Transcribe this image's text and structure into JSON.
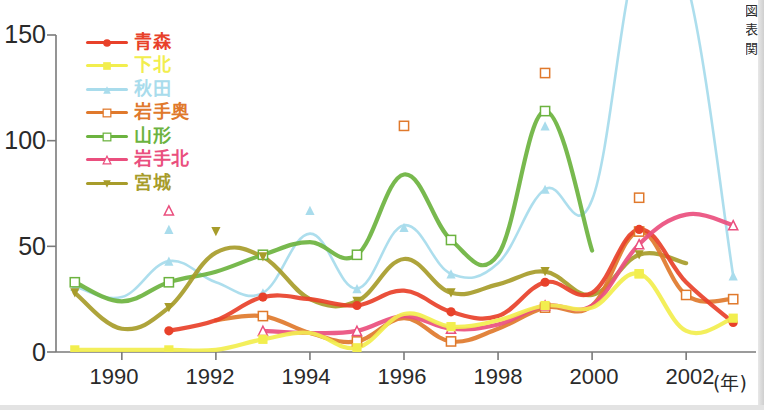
{
  "chart_data": {
    "type": "line",
    "title": "",
    "xlabel": "年",
    "ylabel": "",
    "xlim": [
      1988.6,
      2003.4
    ],
    "ylim": [
      0,
      150
    ],
    "grid": false,
    "legend_position": "top-left",
    "x_ticks": [
      "1990",
      "1992",
      "1994",
      "1996",
      "1998",
      "2000",
      "2002"
    ],
    "x_tick_values": [
      1990,
      1992,
      1994,
      1996,
      1998,
      2000,
      2002
    ],
    "y_ticks": [
      "0",
      "50",
      "100",
      "150"
    ],
    "y_tick_values": [
      0,
      50,
      100,
      150
    ],
    "x": [
      1989,
      1990,
      1991,
      1992,
      1993,
      1994,
      1995,
      1996,
      1997,
      1998,
      1999,
      2000,
      2001,
      2002,
      2003
    ],
    "series": [
      {
        "name": "青森",
        "color": "#e8412a",
        "marker": "filled-circle",
        "values": [
          null,
          null,
          10,
          15,
          26,
          25,
          22,
          29,
          19,
          17,
          33,
          28,
          58,
          33,
          14
        ]
      },
      {
        "name": "下北",
        "color": "#f2ee4e",
        "marker": "filled-square",
        "values": [
          1,
          1,
          1,
          1,
          6,
          9,
          2,
          18,
          12,
          15,
          22,
          21,
          37,
          10,
          16
        ]
      },
      {
        "name": "秋田",
        "color": "#a9dcec",
        "marker": "filled-triangle",
        "values": [
          31,
          26,
          43,
          33,
          28,
          56,
          30,
          60,
          37,
          42,
          77,
          72,
          190,
          176,
          36
        ]
      },
      {
        "name": "岩手奥",
        "color": "#e0792c",
        "marker": "open-square",
        "values": [
          null,
          null,
          null,
          15,
          17,
          9,
          5,
          16,
          5,
          11,
          21,
          22,
          57,
          27,
          25
        ]
      },
      {
        "name": "山形",
        "color": "#6cb33f",
        "marker": "open-square",
        "values": [
          33,
          24,
          33,
          38,
          46,
          52,
          46,
          84,
          53,
          46,
          114,
          48,
          null,
          null,
          null
        ]
      },
      {
        "name": "岩手北",
        "color": "#ea4f7e",
        "marker": "open-triangle",
        "values": [
          null,
          null,
          null,
          null,
          10,
          9,
          10,
          17,
          11,
          13,
          22,
          22,
          51,
          65,
          60
        ]
      },
      {
        "name": "宮城",
        "color": "#a79c2a",
        "marker": "filled-down-triangle",
        "values": [
          28,
          11,
          21,
          47,
          45,
          25,
          24,
          44,
          28,
          32,
          38,
          27,
          46,
          42,
          null
        ]
      }
    ],
    "scatter_markers": [
      {
        "series": "岩手北",
        "x": 1991.0,
        "y": 67,
        "marker": "open-triangle"
      },
      {
        "series": "秋田",
        "x": 1991.0,
        "y": 58,
        "marker": "filled-triangle"
      },
      {
        "series": "宮城",
        "x": 1992.0,
        "y": 57,
        "marker": "filled-down-triangle"
      },
      {
        "series": "秋田",
        "x": 1994.0,
        "y": 67,
        "marker": "filled-triangle"
      },
      {
        "series": "岩手奥",
        "x": 1996.0,
        "y": 107,
        "marker": "open-square"
      },
      {
        "series": "秋田",
        "x": 1996.0,
        "y": 59,
        "marker": "filled-triangle"
      },
      {
        "series": "岩手奥",
        "x": 1999.0,
        "y": 132,
        "marker": "open-square"
      },
      {
        "series": "秋田",
        "x": 1999.0,
        "y": 107,
        "marker": "filled-triangle"
      },
      {
        "series": "岩手奥",
        "x": 2001.0,
        "y": 73,
        "marker": "open-square"
      },
      {
        "series": "下北",
        "x": 2001.0,
        "y": 37,
        "marker": "filled-square"
      },
      {
        "series": "岩手奥",
        "x": 2002.0,
        "y": 27,
        "marker": "open-square"
      }
    ]
  },
  "axis": {
    "x_unit_label": "(年)",
    "y_labels": [
      "150",
      "100",
      "50",
      "0"
    ],
    "x_labels": [
      "1990",
      "1992",
      "1994",
      "1996",
      "1998",
      "2000",
      "2002"
    ]
  },
  "side_note": "図表関",
  "legend": {
    "items": [
      {
        "label": "青森",
        "color": "#e8412a",
        "marker": "filled-circle"
      },
      {
        "label": "下北",
        "color": "#f2ee4e",
        "marker": "filled-square"
      },
      {
        "label": "秋田",
        "color": "#a9dcec",
        "marker": "filled-triangle"
      },
      {
        "label": "岩手奥",
        "color": "#e0792c",
        "marker": "open-square"
      },
      {
        "label": "山形",
        "color": "#6cb33f",
        "marker": "open-square"
      },
      {
        "label": "岩手北",
        "color": "#ea4f7e",
        "marker": "open-triangle"
      },
      {
        "label": "宮城",
        "color": "#a79c2a",
        "marker": "filled-down-triangle"
      }
    ]
  }
}
